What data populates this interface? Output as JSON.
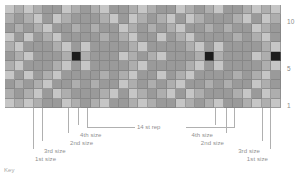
{
  "chart_data": {
    "type": "heatmap",
    "xlabel": "",
    "ylabel": "",
    "columns": 29,
    "rows": 11,
    "row_labels_visible": [
      "10",
      "5",
      "1"
    ],
    "row_label_rows": [
      10,
      5,
      1
    ],
    "legend": [
      "dark grey",
      "mid grey",
      "light grey",
      "black"
    ],
    "colors": {
      "dark": "#9a9a9a",
      "mid": "#aeaeae",
      "light": "#c6c6c6",
      "black": "#1c1c1c",
      "grid_line": "#787878",
      "leader_line": "#b0b0b0",
      "label_text": "#8f8f8f",
      "background": "#ffffff"
    },
    "cells": [
      [
        "l",
        "m",
        "l",
        "m",
        "d",
        "d",
        "l",
        "m",
        "d",
        "m",
        "l",
        "d",
        "d",
        "m",
        "l",
        "m",
        "d",
        "d",
        "l",
        "m",
        "d",
        "m",
        "l",
        "d",
        "d",
        "m",
        "l",
        "m",
        "l"
      ],
      [
        "m",
        "d",
        "m",
        "l",
        "d",
        "l",
        "m",
        "d",
        "d",
        "d",
        "m",
        "l",
        "d",
        "l",
        "m",
        "d",
        "m",
        "l",
        "d",
        "l",
        "m",
        "d",
        "d",
        "d",
        "m",
        "l",
        "d",
        "l",
        "m"
      ],
      [
        "d",
        "m",
        "d",
        "m",
        "l",
        "d",
        "d",
        "m",
        "d",
        "m",
        "d",
        "d",
        "l",
        "m",
        "d",
        "m",
        "d",
        "m",
        "l",
        "d",
        "d",
        "m",
        "d",
        "m",
        "d",
        "d",
        "l",
        "m",
        "d"
      ],
      [
        "l",
        "d",
        "l",
        "d",
        "m",
        "l",
        "d",
        "d",
        "d",
        "d",
        "m",
        "d",
        "m",
        "l",
        "d",
        "d",
        "l",
        "d",
        "m",
        "l",
        "d",
        "d",
        "d",
        "d",
        "m",
        "d",
        "m",
        "l",
        "d"
      ],
      [
        "m",
        "l",
        "d",
        "d",
        "d",
        "m",
        "l",
        "d",
        "l",
        "d",
        "d",
        "d",
        "d",
        "m",
        "l",
        "d",
        "d",
        "d",
        "d",
        "m",
        "l",
        "d",
        "l",
        "d",
        "d",
        "d",
        "d",
        "m",
        "l"
      ],
      [
        "d",
        "m",
        "l",
        "d",
        "d",
        "d",
        "m",
        "k",
        "m",
        "d",
        "d",
        "d",
        "l",
        "m",
        "d",
        "m",
        "l",
        "d",
        "d",
        "d",
        "m",
        "k",
        "m",
        "d",
        "d",
        "d",
        "l",
        "m",
        "k"
      ],
      [
        "m",
        "l",
        "d",
        "d",
        "d",
        "m",
        "l",
        "d",
        "l",
        "d",
        "d",
        "d",
        "d",
        "m",
        "l",
        "d",
        "d",
        "d",
        "d",
        "m",
        "l",
        "d",
        "l",
        "d",
        "d",
        "d",
        "d",
        "m",
        "l"
      ],
      [
        "l",
        "d",
        "l",
        "d",
        "m",
        "l",
        "d",
        "d",
        "d",
        "d",
        "m",
        "d",
        "m",
        "l",
        "d",
        "d",
        "l",
        "d",
        "m",
        "l",
        "d",
        "d",
        "d",
        "d",
        "m",
        "d",
        "m",
        "l",
        "d"
      ],
      [
        "d",
        "m",
        "d",
        "m",
        "l",
        "d",
        "d",
        "m",
        "d",
        "m",
        "d",
        "d",
        "l",
        "m",
        "d",
        "m",
        "d",
        "m",
        "l",
        "d",
        "d",
        "m",
        "d",
        "m",
        "d",
        "d",
        "l",
        "m",
        "d"
      ],
      [
        "m",
        "d",
        "m",
        "l",
        "d",
        "l",
        "m",
        "d",
        "d",
        "d",
        "m",
        "l",
        "d",
        "l",
        "m",
        "d",
        "m",
        "l",
        "d",
        "l",
        "m",
        "d",
        "d",
        "d",
        "m",
        "l",
        "d",
        "l",
        "m"
      ],
      [
        "l",
        "m",
        "l",
        "m",
        "d",
        "d",
        "l",
        "m",
        "d",
        "m",
        "l",
        "d",
        "d",
        "m",
        "l",
        "m",
        "d",
        "d",
        "l",
        "m",
        "d",
        "m",
        "l",
        "d",
        "d",
        "m",
        "l",
        "m",
        "l"
      ]
    ],
    "annotations": {
      "repeat_label": "14 st rep",
      "left_size_markers": [
        {
          "label": "1st size",
          "tick_x": 33
        },
        {
          "label": "3rd size",
          "tick_x": 42
        },
        {
          "label": "2nd size",
          "tick_x": 68
        },
        {
          "label": "4th size",
          "tick_x": 78
        }
      ],
      "right_size_markers": [
        {
          "label": "4th size",
          "tick_x": 215
        },
        {
          "label": "2nd size",
          "tick_x": 226
        },
        {
          "label": "3rd size",
          "tick_x": 262
        },
        {
          "label": "1st size",
          "tick_x": 270
        }
      ],
      "repeat_start_x": 87,
      "repeat_end_x": 234,
      "key_label": "Key"
    }
  },
  "labels": {
    "row_10": "10",
    "row_5": "5",
    "row_1": "1",
    "repeat": "14 st rep",
    "left_1": "1st size",
    "left_2": "3rd size",
    "left_3": "2nd size",
    "left_4": "4th size",
    "right_1": "4th size",
    "right_2": "2nd size",
    "right_3": "3rd size",
    "right_4": "1st size",
    "key": "Key"
  }
}
